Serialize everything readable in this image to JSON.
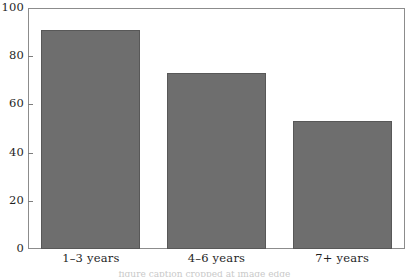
{
  "figure": {
    "background_color": "#ffffff",
    "frame_color": "#8c8c8c"
  },
  "chart_data": {
    "type": "bar",
    "title": "",
    "subtitle": "",
    "xlabel": "",
    "ylabel": "",
    "categories": [
      "1–3 years",
      "4–6 years",
      "7+ years"
    ],
    "values": [
      91,
      73,
      53
    ],
    "series": [
      {
        "name": "",
        "values": [
          91,
          73,
          53
        ]
      }
    ],
    "ylim": [
      0,
      100
    ],
    "y_ticks": [
      0,
      20,
      40,
      60,
      80,
      100
    ],
    "y_tick_labels": [
      "0",
      "20",
      "40",
      "60",
      "80",
      "100"
    ],
    "grid": false,
    "legend": false,
    "legend_position": "none",
    "bar_color": "#6e6e6e",
    "bar_edge_color": "#585858",
    "annotations": []
  },
  "caption": {
    "text": "figure caption cropped at image edge"
  }
}
